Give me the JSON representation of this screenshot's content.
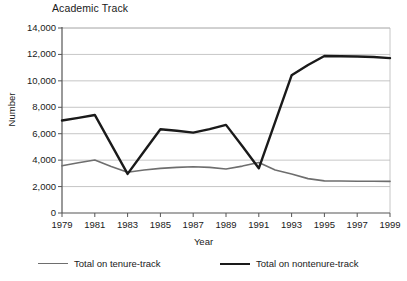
{
  "chart_data": {
    "type": "line",
    "title": "Academic Track",
    "xlabel": "Year",
    "ylabel": "Number",
    "x": [
      1979,
      1980,
      1981,
      1982,
      1983,
      1984,
      1985,
      1986,
      1987,
      1988,
      1989,
      1990,
      1991,
      1992,
      1993,
      1994,
      1995,
      1996,
      1997,
      1998,
      1999
    ],
    "xtick_labels": [
      "1979",
      "1981",
      "1983",
      "1985",
      "1987",
      "1989",
      "1991",
      "1993",
      "1995",
      "1997",
      "1999"
    ],
    "xticks": [
      1979,
      1981,
      1983,
      1985,
      1987,
      1989,
      1991,
      1993,
      1995,
      1997,
      1999
    ],
    "ytick_labels": [
      "0",
      "2,000",
      "4,000",
      "6,000",
      "8,000",
      "10,000",
      "12,000",
      "14,000"
    ],
    "yticks": [
      0,
      2000,
      4000,
      6000,
      8000,
      10000,
      12000,
      14000
    ],
    "ylim": [
      0,
      14000
    ],
    "xlim": [
      1979,
      1999
    ],
    "grid": "horizontal",
    "legend_position": "bottom",
    "series": [
      {
        "name": "Total on tenure-track",
        "color": "#6e6e6e",
        "width": 1.6,
        "values": [
          3570,
          3800,
          4010,
          3520,
          3080,
          3250,
          3380,
          3450,
          3500,
          3450,
          3330,
          3550,
          3820,
          3250,
          2950,
          2600,
          2430,
          2420,
          2400,
          2400,
          2390
        ]
      },
      {
        "name": "Total on nontenure-track",
        "color": "#1a1a1a",
        "width": 2.4,
        "values": [
          7000,
          7200,
          7420,
          5200,
          2960,
          4650,
          6340,
          6220,
          6080,
          6350,
          6670,
          5050,
          3380,
          6900,
          10420,
          11200,
          11880,
          11860,
          11840,
          11800,
          11720
        ]
      }
    ]
  },
  "legend": {
    "items": [
      {
        "label": "Total on tenure-track",
        "color": "#6e6e6e"
      },
      {
        "label": "Total on nontenure-track",
        "color": "#1a1a1a"
      }
    ]
  }
}
